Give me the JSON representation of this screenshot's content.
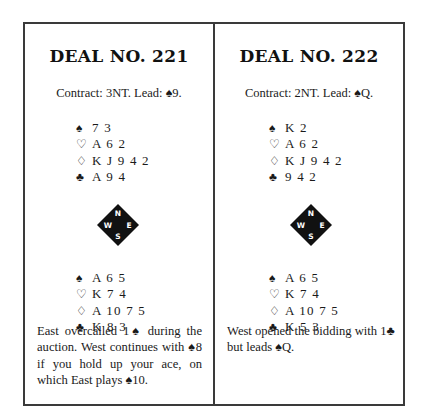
{
  "deals": [
    {
      "title": "DEAL NO. 221",
      "contract": "Contract: 3NT. Lead: ♠9.",
      "north": [
        {
          "suit_icon": "♠",
          "suit": "spades",
          "cards": "7 3"
        },
        {
          "suit_icon": "♡",
          "suit": "hearts",
          "cards": "A 6 2"
        },
        {
          "suit_icon": "♢",
          "suit": "diamonds",
          "cards": "K J 9 4 2"
        },
        {
          "suit_icon": "♣",
          "suit": "clubs",
          "cards": "A 9 4"
        }
      ],
      "south": [
        {
          "suit_icon": "♠",
          "suit": "spades",
          "cards": "A 6 5"
        },
        {
          "suit_icon": "♡",
          "suit": "hearts",
          "cards": "K 7 4"
        },
        {
          "suit_icon": "♢",
          "suit": "diamonds",
          "cards": "A 10 7 5"
        },
        {
          "suit_icon": "♣",
          "suit": "clubs",
          "cards": "K 8 3"
        }
      ],
      "compass": {
        "n": "N",
        "e": "E",
        "s": "S",
        "w": "W"
      },
      "note": "East overcalled 1♠ during the auction. West continues with ♠8 if you hold up your ace, on which East plays ♠10."
    },
    {
      "title": "DEAL NO. 222",
      "contract": "Contract: 2NT. Lead: ♠Q.",
      "north": [
        {
          "suit_icon": "♠",
          "suit": "spades",
          "cards": "K 2"
        },
        {
          "suit_icon": "♡",
          "suit": "hearts",
          "cards": "A 6 2"
        },
        {
          "suit_icon": "♢",
          "suit": "diamonds",
          "cards": "K J 9 4 2"
        },
        {
          "suit_icon": "♣",
          "suit": "clubs",
          "cards": "9 4 2"
        }
      ],
      "south": [
        {
          "suit_icon": "♠",
          "suit": "spades",
          "cards": "A 6 5"
        },
        {
          "suit_icon": "♡",
          "suit": "hearts",
          "cards": "K 7 4"
        },
        {
          "suit_icon": "♢",
          "suit": "diamonds",
          "cards": "A 10 7 5"
        },
        {
          "suit_icon": "♣",
          "suit": "clubs",
          "cards": "K 5 3"
        }
      ],
      "compass": {
        "n": "N",
        "e": "E",
        "s": "S",
        "w": "W"
      },
      "note": "West opened the bidding with 1♣ but leads ♠Q."
    }
  ],
  "colors": {
    "ink": "#1a1a1a",
    "frame": "#3a3a3a",
    "compass_fill": "#111111",
    "compass_text": "#ffffff"
  }
}
